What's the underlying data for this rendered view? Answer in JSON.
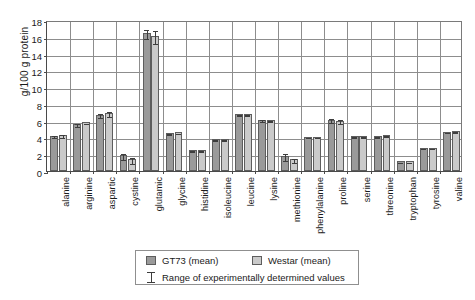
{
  "chart_data": {
    "type": "bar",
    "title": "",
    "xlabel": "",
    "ylabel": "g/100 g protein",
    "ylim": [
      0,
      18
    ],
    "yticks": [
      0,
      2,
      4,
      6,
      8,
      10,
      12,
      14,
      16,
      18
    ],
    "grid": true,
    "legend_position": "bottom",
    "categories": [
      "alanine",
      "arginine",
      "aspartic",
      "cystine",
      "glutamic",
      "glycine",
      "histidine",
      "isoleucine",
      "leucine",
      "lysine",
      "methionine",
      "phenylalanine",
      "proline",
      "serine",
      "threonine",
      "tryptophan",
      "tyrosine",
      "valine"
    ],
    "series": [
      {
        "name": "GT73 (mean)",
        "color": "#9a9a9a",
        "values": [
          4.2,
          5.6,
          6.7,
          1.9,
          16.5,
          4.5,
          2.5,
          3.8,
          6.8,
          6.1,
          1.8,
          4.1,
          6.1,
          4.2,
          4.2,
          1.2,
          2.8,
          4.7
        ],
        "err_low": [
          4.0,
          5.4,
          6.4,
          1.4,
          15.9,
          4.4,
          2.4,
          3.7,
          6.7,
          5.9,
          1.3,
          4.0,
          5.8,
          4.1,
          4.1,
          1.15,
          2.7,
          4.6
        ],
        "err_high": [
          4.4,
          5.8,
          7.0,
          2.3,
          17.1,
          4.6,
          2.6,
          3.9,
          6.9,
          6.3,
          2.3,
          4.2,
          6.4,
          4.3,
          4.3,
          1.25,
          2.9,
          4.8
        ]
      },
      {
        "name": "Westar (mean)",
        "color": "#cacaca",
        "values": [
          4.3,
          5.8,
          6.9,
          1.4,
          16.1,
          4.6,
          2.5,
          3.8,
          6.8,
          6.1,
          1.4,
          4.1,
          6.0,
          4.2,
          4.3,
          1.2,
          2.8,
          4.8
        ],
        "err_low": [
          4.1,
          5.7,
          6.5,
          1.0,
          15.3,
          4.5,
          2.4,
          3.7,
          6.7,
          6.0,
          1.1,
          4.0,
          5.7,
          4.1,
          4.2,
          1.15,
          2.7,
          4.7
        ],
        "err_high": [
          4.5,
          5.9,
          7.3,
          1.8,
          16.9,
          4.7,
          2.6,
          3.9,
          6.9,
          6.2,
          1.7,
          4.2,
          6.3,
          4.3,
          4.4,
          1.25,
          2.9,
          4.9
        ]
      }
    ],
    "annotations": [
      "Range of experimentally determined values"
    ]
  },
  "legend": {
    "series_1_label": "GT73 (mean)",
    "series_2_label": "Westar (mean)",
    "range_label": "Range of experimentally determined values"
  }
}
